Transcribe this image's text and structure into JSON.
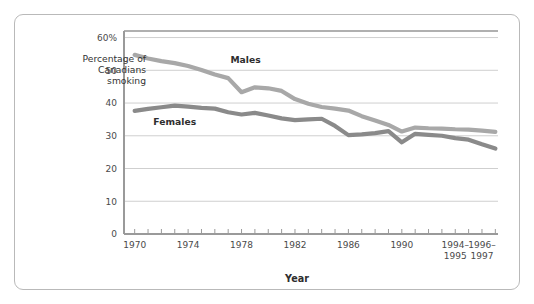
{
  "figure": {
    "border_color": "#b9b9b9",
    "background": "#ffffff"
  },
  "axis": {
    "y_axis_caption_line1": "Percentage of",
    "y_axis_caption_line2": "Canadians",
    "y_axis_caption_line3": "smoking",
    "x_axis_title": "Year",
    "y_ticks": [
      "0",
      "10",
      "20",
      "30",
      "40",
      "50",
      "60%"
    ],
    "y_tick_values": [
      0,
      10,
      20,
      30,
      40,
      50,
      60
    ],
    "x_tick_labels": [
      {
        "line1": "1970",
        "line2": ""
      },
      {
        "line1": "1974",
        "line2": ""
      },
      {
        "line1": "1978",
        "line2": ""
      },
      {
        "line1": "1982",
        "line2": ""
      },
      {
        "line1": "1986",
        "line2": ""
      },
      {
        "line1": "1990",
        "line2": ""
      },
      {
        "line1": "1994–",
        "line2": "1995"
      },
      {
        "line1": "1996–",
        "line2": "1997"
      }
    ],
    "x_tick_at": [
      1970,
      1974,
      1978,
      1982,
      1986,
      1990,
      1994,
      1996
    ],
    "gridline_color": "#cfcfcf",
    "axis_line_color": "#9a9a9a"
  },
  "series_labels": {
    "males": "Males",
    "females": "Females"
  },
  "chart_data": {
    "type": "line",
    "title": "",
    "subtitle": "",
    "xlabel": "Year",
    "ylabel": "Percentage of Canadians smoking",
    "xlim": [
      1969.2,
      1997.2
    ],
    "ylim": [
      0,
      62
    ],
    "grid": true,
    "legend": "inline-labels",
    "x": [
      1970,
      1971,
      1972,
      1973,
      1974,
      1975,
      1976,
      1977,
      1978,
      1979,
      1980,
      1981,
      1982,
      1983,
      1984,
      1985,
      1986,
      1987,
      1988,
      1989,
      1990,
      1991,
      1992,
      1993,
      1994,
      1995,
      1996,
      1997
    ],
    "x_tick_display": [
      "1970",
      "1974",
      "1978",
      "1982",
      "1986",
      "1990",
      "1994–1995",
      "1996–1997"
    ],
    "series": [
      {
        "name": "Males",
        "color": "#a8a8a8",
        "values": [
          54.7,
          53.6,
          52.8,
          52.2,
          51.3,
          50.1,
          48.7,
          47.6,
          43.3,
          44.8,
          44.5,
          43.7,
          41.2,
          39.8,
          38.8,
          38.3,
          37.7,
          36.0,
          34.7,
          33.3,
          31.3,
          32.5,
          32.3,
          32.2,
          32.0,
          31.9,
          31.6,
          31.2
        ]
      },
      {
        "name": "Females",
        "color": "#8a8a8a",
        "values": [
          37.6,
          38.2,
          38.7,
          39.2,
          38.9,
          38.5,
          38.3,
          37.2,
          36.5,
          37.0,
          36.2,
          35.3,
          34.8,
          35.0,
          35.2,
          33.0,
          30.2,
          30.4,
          30.8,
          31.4,
          28.0,
          30.6,
          30.3,
          30.0,
          29.3,
          28.8,
          27.4,
          26.1
        ]
      }
    ],
    "annotations": [
      {
        "text": "Males",
        "x": 1978.3,
        "y": 52.3
      },
      {
        "text": "Females",
        "x": 1973.0,
        "y": 33.4
      }
    ]
  }
}
